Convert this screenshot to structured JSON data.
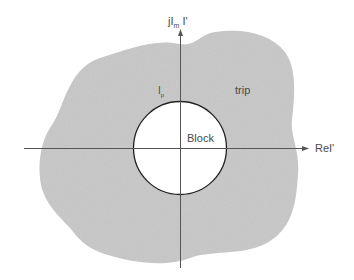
{
  "diagram": {
    "type": "impedance-plane characteristic",
    "axes": {
      "imag_label_prefix": "jI",
      "imag_label_sub": "m",
      "imag_label_suffix": " I'",
      "real_label": "ReI'"
    },
    "regions": {
      "outer_label": "trip",
      "inner_label": "Block"
    },
    "pickup_label": "I",
    "pickup_sub": "p",
    "colors": {
      "trip_region_fill": "#c8c8c8",
      "block_region_fill": "#ffffff",
      "axis_color": "#555555",
      "circle_color": "#222222",
      "text_color": "#4a4a4a"
    }
  }
}
